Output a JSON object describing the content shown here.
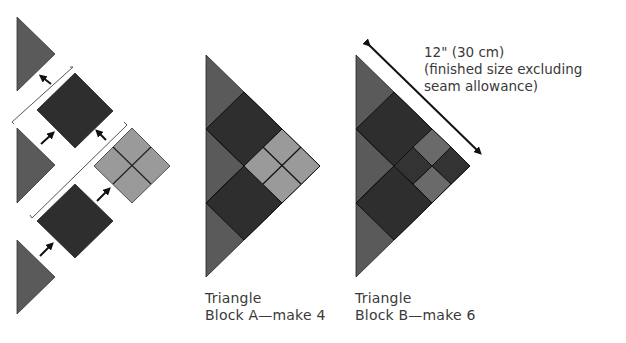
{
  "colors": {
    "background": "#ffffff",
    "triangle_fill": "#5a5a5a",
    "dark_square": "#2e2e2e",
    "light_square": "#9a9a9a",
    "medium_square": "#6a6a6a",
    "seam_line": "#111111",
    "text": "#3a3a3a",
    "bracket": "#555555",
    "arrow": "#111111"
  },
  "assembly": {
    "description": "Exploded assembly of triangle block A",
    "pieces": [
      {
        "type": "triangle",
        "label": "setting-triangle-top"
      },
      {
        "type": "dark-square",
        "label": "dark-square-upper"
      },
      {
        "type": "triangle",
        "label": "setting-triangle-middle"
      },
      {
        "type": "four-patch",
        "label": "light-four-patch"
      },
      {
        "type": "dark-square",
        "label": "dark-square-lower"
      },
      {
        "type": "triangle",
        "label": "setting-triangle-bottom"
      }
    ]
  },
  "block_a": {
    "caption_line1": "Triangle",
    "caption_line2": "Block A—make 4"
  },
  "block_b": {
    "caption_line1": "Triangle",
    "caption_line2": "Block B—make 6"
  },
  "dimension": {
    "line1": "12\" (30 cm)",
    "line2": "(finished size excluding",
    "line3": "seam allowance)"
  }
}
